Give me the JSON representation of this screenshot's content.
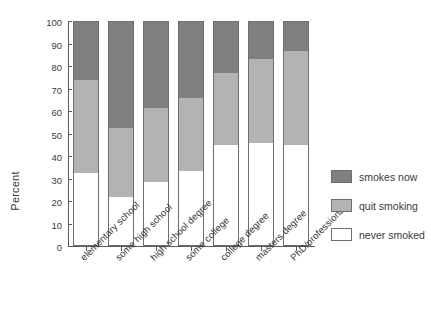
{
  "chart": {
    "type": "bar",
    "ylabel": "Percent",
    "yticks": [
      "100",
      "90",
      "80",
      "70",
      "60",
      "50",
      "40",
      "30",
      "20",
      "10",
      "0"
    ]
  },
  "legend": {
    "items": [
      {
        "label": "smokes now",
        "color": "#808080"
      },
      {
        "label": "quit smoking",
        "color": "#b3b3b3"
      },
      {
        "label": "never smoked",
        "color": "#ffffff"
      }
    ]
  },
  "chart_data": {
    "type": "bar",
    "stacked": true,
    "title": "",
    "subtitle": "",
    "xlabel": "",
    "ylabel": "Percent",
    "ylim": [
      0,
      100
    ],
    "ytick_step": 10,
    "grid": false,
    "legend_position": "right",
    "categories": [
      "elementary school",
      "some high school",
      "high school degree",
      "some college",
      "college degree",
      "masters degree",
      "PhD/professional"
    ],
    "series": [
      {
        "name": "never smoked",
        "color": "#ffffff",
        "values": [
          32.5,
          22.0,
          28.5,
          33.5,
          45.0,
          46.0,
          45.0
        ]
      },
      {
        "name": "quit smoking",
        "color": "#b3b3b3",
        "values": [
          41.5,
          30.5,
          33.0,
          32.5,
          32.0,
          37.0,
          41.5
        ]
      },
      {
        "name": "smokes now",
        "color": "#808080",
        "values": [
          26.0,
          47.5,
          38.5,
          34.0,
          23.0,
          17.0,
          13.5
        ]
      }
    ],
    "cumulative_tops": {
      "never smoked": [
        32.5,
        22.0,
        28.5,
        33.5,
        45.0,
        46.0,
        45.0
      ],
      "quit smoking": [
        74.0,
        52.5,
        61.5,
        66.0,
        77.0,
        83.0,
        86.5
      ],
      "smokes now": [
        100,
        100,
        100,
        100,
        100,
        100,
        100
      ]
    }
  }
}
